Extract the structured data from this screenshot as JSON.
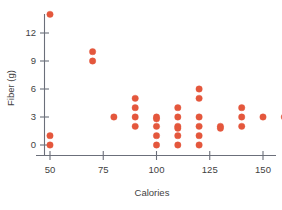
{
  "chart_data": {
    "type": "scatter",
    "title": "",
    "subtitle": "",
    "xlabel": "Calories",
    "ylabel": "Fiber (g)",
    "xlim": [
      38,
      172
    ],
    "ylim": [
      -1.2,
      15
    ],
    "xticks": [
      50,
      75,
      100,
      125,
      150
    ],
    "xticklabels": [
      "50",
      "75",
      "100",
      "125",
      "150"
    ],
    "yticks": [
      0,
      3,
      6,
      9,
      12
    ],
    "yticklabels": [
      "0",
      "3",
      "6",
      "9",
      "12"
    ],
    "grid": false,
    "legend": null,
    "marker_color": "#e4573c",
    "marker_size": 4.2,
    "axis_color": "#6b6f7a",
    "points": [
      {
        "x": 50,
        "y": 14
      },
      {
        "x": 50,
        "y": 1
      },
      {
        "x": 50,
        "y": 0
      },
      {
        "x": 70,
        "y": 10
      },
      {
        "x": 70,
        "y": 9
      },
      {
        "x": 80,
        "y": 3
      },
      {
        "x": 90,
        "y": 5
      },
      {
        "x": 90,
        "y": 4
      },
      {
        "x": 90,
        "y": 3
      },
      {
        "x": 90,
        "y": 2
      },
      {
        "x": 100,
        "y": 3
      },
      {
        "x": 100,
        "y": 2.8
      },
      {
        "x": 100,
        "y": 2
      },
      {
        "x": 100,
        "y": 1
      },
      {
        "x": 100,
        "y": 0
      },
      {
        "x": 110,
        "y": 4
      },
      {
        "x": 110,
        "y": 3
      },
      {
        "x": 110,
        "y": 2
      },
      {
        "x": 110,
        "y": 1.8
      },
      {
        "x": 110,
        "y": 1
      },
      {
        "x": 110,
        "y": 0
      },
      {
        "x": 120,
        "y": 6
      },
      {
        "x": 120,
        "y": 5
      },
      {
        "x": 120,
        "y": 3
      },
      {
        "x": 120,
        "y": 2
      },
      {
        "x": 120,
        "y": 1
      },
      {
        "x": 120,
        "y": 0
      },
      {
        "x": 130,
        "y": 2
      },
      {
        "x": 130,
        "y": 1.8
      },
      {
        "x": 140,
        "y": 4
      },
      {
        "x": 140,
        "y": 3
      },
      {
        "x": 140,
        "y": 2
      },
      {
        "x": 150,
        "y": 3
      },
      {
        "x": 160,
        "y": 3
      }
    ]
  },
  "axes": {
    "x_title": "Calories",
    "y_title": "Fiber (g)"
  },
  "ticks": {
    "x": [
      "50",
      "75",
      "100",
      "125",
      "150"
    ],
    "y": [
      "0",
      "3",
      "6",
      "9",
      "12"
    ]
  }
}
